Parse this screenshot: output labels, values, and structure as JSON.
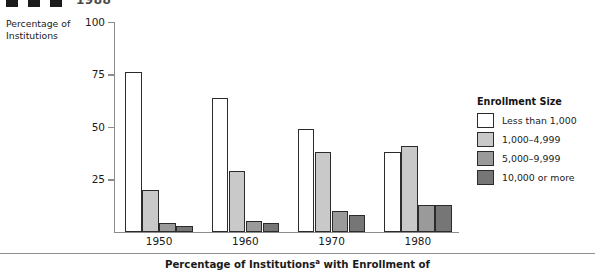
{
  "header": {
    "marker_count": 3,
    "cut_text": "1988"
  },
  "y_axis_title": "Percentage of Institutions",
  "caption": {
    "prefix": "Percentage of Institutions",
    "superscript": "a",
    "suffix": " with Enrollment of"
  },
  "legend": {
    "title": "Enrollment Size",
    "items": [
      {
        "label": "Less than 1,000",
        "color": "#ffffff"
      },
      {
        "label": "1,000–4,999",
        "color": "#c9c9c9"
      },
      {
        "label": "5,000–9,999",
        "color": "#9a9a9a"
      },
      {
        "label": "10,000 or more",
        "color": "#767676"
      }
    ]
  },
  "chart_data": {
    "type": "bar",
    "xlabel": "",
    "ylabel": "Percentage of Institutions",
    "ylim": [
      0,
      100
    ],
    "yticks": [
      0,
      25,
      50,
      75,
      100
    ],
    "ytick_labels": [
      "",
      "25",
      "50",
      "75",
      "100"
    ],
    "grid": false,
    "legend_position": "right",
    "categories": [
      "1950",
      "1960",
      "1970",
      "1980"
    ],
    "series": [
      {
        "name": "Less than 1,000",
        "color": "#ffffff",
        "values": [
          76,
          64,
          49,
          38
        ]
      },
      {
        "name": "1,000–4,999",
        "color": "#c9c9c9",
        "values": [
          20,
          29,
          38,
          41
        ]
      },
      {
        "name": "5,000–9,999",
        "color": "#9a9a9a",
        "values": [
          4,
          5,
          10,
          13
        ]
      },
      {
        "name": "10,000 or more",
        "color": "#767676",
        "values": [
          3,
          4,
          8,
          13
        ]
      }
    ]
  }
}
